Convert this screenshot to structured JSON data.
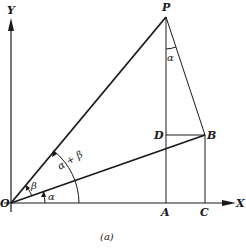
{
  "figure": {
    "caption": "(a)",
    "axes": {
      "x_label": "X",
      "y_label": "Y"
    },
    "points": {
      "O": "O",
      "P": "P",
      "A": "A",
      "B": "B",
      "C": "C",
      "D": "D"
    },
    "angles": {
      "alpha_at_O": "α",
      "beta_at_O": "β",
      "alpha_plus_beta": "α + β",
      "alpha_at_P": "α"
    }
  }
}
